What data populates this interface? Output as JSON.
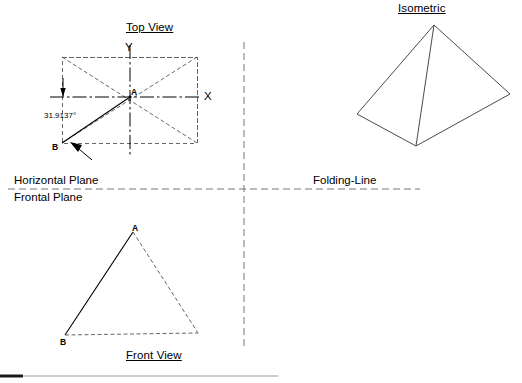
{
  "sheet": {
    "width": 522,
    "height": 383,
    "background": "#ffffff",
    "line_color": "#000000",
    "hidden_line_color": "#555555",
    "iso_line_color": "#4a4a4a",
    "footer_rule_dark": "#1a1a1a",
    "footer_rule_light": "#9a9a9a"
  },
  "titles": {
    "top_view": "Top View",
    "front_view": "Front View",
    "isometric": "Isometric"
  },
  "planes": {
    "horizontal": "Horizontal Plane",
    "frontal": "Frontal Plane",
    "folding_line": "Folding-Line"
  },
  "top_view": {
    "axis_x": "X",
    "axis_y": "Y",
    "point_a": "A",
    "point_b": "B",
    "angle": "31.9137°"
  },
  "front_view": {
    "point_a": "A",
    "point_b": "B"
  },
  "geometry": {
    "top_view_rect": {
      "x1": 62,
      "y1": 57,
      "x2": 197,
      "y2": 143
    },
    "top_view_center": {
      "x": 130,
      "y": 97
    },
    "top_view_corner_b": {
      "x": 62,
      "y": 143
    },
    "x_axis": {
      "x1": 50,
      "y1": 97,
      "x2": 199,
      "y2": 97
    },
    "y_axis": {
      "x1": 130,
      "y1": 45,
      "x2": 130,
      "y2": 155
    },
    "front_view_apex": {
      "x": 133,
      "y": 232
    },
    "front_view_left": {
      "x": 65,
      "y": 335
    },
    "front_view_right": {
      "x": 198,
      "y": 333
    },
    "folding_line_y": 189,
    "folding_line_x": 244,
    "folding_line_span": {
      "x1": 8,
      "x2": 420
    },
    "folding_vertical_span": {
      "y1": 42,
      "y2": 346
    },
    "isometric_apex": {
      "x": 434,
      "y": 25
    },
    "isometric_left": {
      "x": 357,
      "y": 114
    },
    "isometric_front": {
      "x": 416,
      "y": 146
    },
    "isometric_right": {
      "x": 510,
      "y": 94
    },
    "footer_rule_y": 376
  }
}
